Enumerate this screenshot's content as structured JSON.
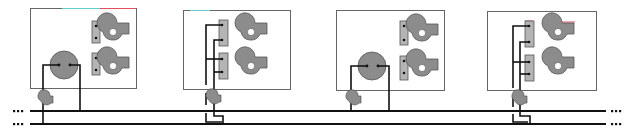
{
  "diagram": {
    "colors": {
      "line": "#111111",
      "fill_gray": "#8c8c8c",
      "strip_gray": "#b4b4b4",
      "box_border": "#666666",
      "accent_cyan": "#5fd0d0",
      "accent_red": "#e05060"
    },
    "bus": {
      "lines": 2,
      "continuation_marker": "..."
    },
    "panels": [
      {
        "id": 1,
        "type": "round-unit",
        "fans": 2,
        "terminal_strips": 2
      },
      {
        "id": 2,
        "type": "terminal-wiring",
        "fans": 2,
        "terminal_strips": 2
      },
      {
        "id": 3,
        "type": "round-unit",
        "fans": 2,
        "terminal_strips": 2
      },
      {
        "id": 4,
        "type": "terminal-wiring",
        "fans": 2,
        "terminal_strips": 2
      }
    ]
  }
}
